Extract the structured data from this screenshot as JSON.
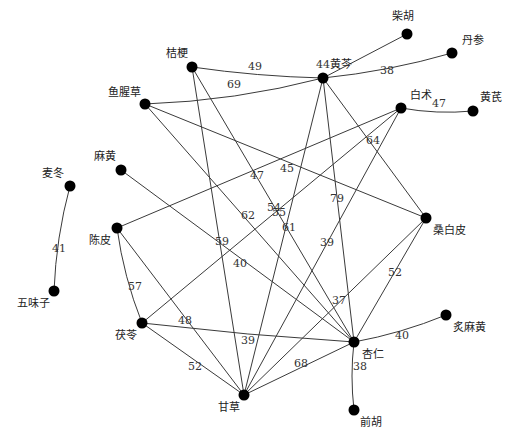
{
  "chart_data": {
    "type": "network",
    "title": "",
    "nodes": [
      {
        "id": "柴胡",
        "x": 407,
        "y": 34,
        "lx": 392,
        "ly": 20
      },
      {
        "id": "丹参",
        "x": 452,
        "y": 53,
        "lx": 462,
        "ly": 44
      },
      {
        "id": "黄芩",
        "x": 323,
        "y": 78,
        "lx": 330,
        "ly": 68
      },
      {
        "id": "桔梗",
        "x": 192,
        "y": 67,
        "lx": 166,
        "ly": 57
      },
      {
        "id": "鱼腥草",
        "x": 145,
        "y": 104,
        "lx": 108,
        "ly": 96
      },
      {
        "id": "白术",
        "x": 401,
        "y": 108,
        "lx": 410,
        "ly": 99
      },
      {
        "id": "黄芪",
        "x": 473,
        "y": 111,
        "lx": 480,
        "ly": 101
      },
      {
        "id": "麦冬",
        "x": 70,
        "y": 186,
        "lx": 42,
        "ly": 177
      },
      {
        "id": "麻黄",
        "x": 121,
        "y": 170,
        "lx": 94,
        "ly": 160
      },
      {
        "id": "陈皮",
        "x": 117,
        "y": 228,
        "lx": 89,
        "ly": 244
      },
      {
        "id": "桑白皮",
        "x": 426,
        "y": 218,
        "lx": 433,
        "ly": 234
      },
      {
        "id": "五味子",
        "x": 54,
        "y": 291,
        "lx": 17,
        "ly": 307
      },
      {
        "id": "茯苓",
        "x": 142,
        "y": 323,
        "lx": 115,
        "ly": 339
      },
      {
        "id": "杏仁",
        "x": 354,
        "y": 342,
        "lx": 362,
        "ly": 358
      },
      {
        "id": "炙麻黄",
        "x": 446,
        "y": 315,
        "lx": 453,
        "ly": 331
      },
      {
        "id": "甘草",
        "x": 244,
        "y": 395,
        "lx": 218,
        "ly": 411
      },
      {
        "id": "前胡",
        "x": 354,
        "y": 410,
        "lx": 360,
        "ly": 426
      }
    ],
    "edges": [
      {
        "source": "黄芩",
        "target": "柴胡",
        "weight": 44,
        "lx": 316,
        "ly": 68,
        "curve": 0
      },
      {
        "source": "黄芩",
        "target": "丹参",
        "weight": 38,
        "lx": 380,
        "ly": 74,
        "curve": 6
      },
      {
        "source": "桔梗",
        "target": "黄芩",
        "weight": 49,
        "lx": 248,
        "ly": 70,
        "curve": 4
      },
      {
        "source": "鱼腥草",
        "target": "黄芩",
        "weight": 69,
        "lx": 227,
        "ly": 88,
        "curve": 10
      },
      {
        "source": "白术",
        "target": "黄芪",
        "weight": 47,
        "lx": 432,
        "ly": 107,
        "curve": 5
      },
      {
        "source": "麦冬",
        "target": "五味子",
        "weight": 41,
        "lx": 52,
        "ly": 252,
        "curve": 6
      },
      {
        "source": "黄芩",
        "target": "桑白皮",
        "weight": 64,
        "lx": 366,
        "ly": 144,
        "curve": 0
      },
      {
        "source": "黄芩",
        "target": "杏仁",
        "weight": 79,
        "lx": 330,
        "ly": 202,
        "curve": 0
      },
      {
        "source": "黄芩",
        "target": "甘草",
        "weight": 61,
        "lx": 282,
        "ly": 231,
        "curve": 0
      },
      {
        "source": "鱼腥草",
        "target": "桑白皮",
        "weight": 45,
        "lx": 280,
        "ly": 172,
        "curve": 0
      },
      {
        "source": "鱼腥草",
        "target": "杏仁",
        "weight": 62,
        "lx": 241,
        "ly": 219,
        "curve": 0
      },
      {
        "source": "桔梗",
        "target": "甘草",
        "weight": 59,
        "lx": 215,
        "ly": 245,
        "curve": 0
      },
      {
        "source": "桔梗",
        "target": "杏仁",
        "weight": 55,
        "lx": 272,
        "ly": 216,
        "curve": 0
      },
      {
        "source": "白术",
        "target": "陈皮",
        "weight": 47,
        "lx": 250,
        "ly": 179,
        "curve": 0
      },
      {
        "source": "白术",
        "target": "茯苓",
        "weight": 54,
        "lx": 267,
        "ly": 211,
        "curve": 0
      },
      {
        "source": "白术",
        "target": "甘草",
        "weight": 39,
        "lx": 320,
        "ly": 246,
        "curve": 0
      },
      {
        "source": "麻黄",
        "target": "杏仁",
        "weight": 40,
        "lx": 233,
        "ly": 267,
        "curve": 0
      },
      {
        "source": "陈皮",
        "target": "茯苓",
        "weight": 57,
        "lx": 128,
        "ly": 290,
        "curve": 6
      },
      {
        "source": "陈皮",
        "target": "甘草",
        "weight": 48,
        "lx": 178,
        "ly": 324,
        "curve": 0
      },
      {
        "source": "茯苓",
        "target": "杏仁",
        "weight": 39,
        "lx": 241,
        "ly": 344,
        "curve": 3
      },
      {
        "source": "茯苓",
        "target": "甘草",
        "weight": 52,
        "lx": 188,
        "ly": 370,
        "curve": 0
      },
      {
        "source": "桑白皮",
        "target": "杏仁",
        "weight": 52,
        "lx": 388,
        "ly": 276,
        "curve": 0
      },
      {
        "source": "桑白皮",
        "target": "甘草",
        "weight": 37,
        "lx": 332,
        "ly": 304,
        "curve": 0
      },
      {
        "source": "甘草",
        "target": "杏仁",
        "weight": 68,
        "lx": 294,
        "ly": 367,
        "curve": 0
      },
      {
        "source": "杏仁",
        "target": "炙麻黄",
        "weight": 40,
        "lx": 395,
        "ly": 339,
        "curve": 5
      },
      {
        "source": "杏仁",
        "target": "前胡",
        "weight": 38,
        "lx": 353,
        "ly": 370,
        "curve": 4
      }
    ]
  }
}
